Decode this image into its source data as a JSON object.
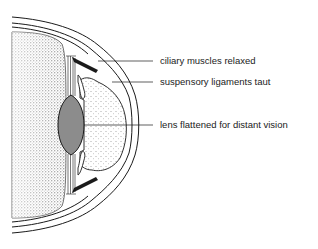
{
  "diagram": {
    "labels": [
      {
        "id": "ciliary",
        "text": "ciliary muscles relaxed",
        "y": 61
      },
      {
        "id": "suspensory",
        "text": "suspensory ligaments taut",
        "y": 82
      },
      {
        "id": "lens",
        "text": "lens flattened for distant vision",
        "y": 125
      }
    ],
    "colors": {
      "line": "#1a1a1a",
      "lens_fill": "#8c8c8c",
      "stipple": "#333333",
      "background": "#ffffff"
    }
  }
}
